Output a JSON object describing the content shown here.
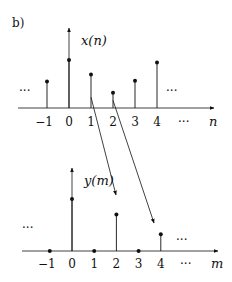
{
  "panel_label": "b)",
  "chart_data": [
    {
      "type": "stem",
      "title": "x(n)",
      "xlabel": "n",
      "x": [
        -1,
        0,
        1,
        2,
        3,
        4
      ],
      "values": [
        0.55,
        1.0,
        0.7,
        0.32,
        0.57,
        0.95
      ],
      "tick_labels": [
        "−1",
        "0",
        "1",
        "2",
        "3",
        "4"
      ],
      "ellipsis_left": "···",
      "ellipsis_right": "···",
      "ellipsis_axis": "···"
    },
    {
      "type": "stem",
      "title": "y(m)",
      "xlabel": "m",
      "x": [
        -1,
        0,
        1,
        2,
        3,
        4
      ],
      "values": [
        0,
        1.0,
        0,
        0.7,
        0,
        0.32
      ],
      "tick_labels": [
        "−1",
        "0",
        "1",
        "2",
        "3",
        "4"
      ],
      "ellipsis_left": "···",
      "ellipsis_right": "···",
      "ellipsis_axis": "···"
    }
  ],
  "mappings": [
    {
      "from_n": 1,
      "to_m": 2
    },
    {
      "from_n": 2,
      "to_m": 4
    }
  ]
}
